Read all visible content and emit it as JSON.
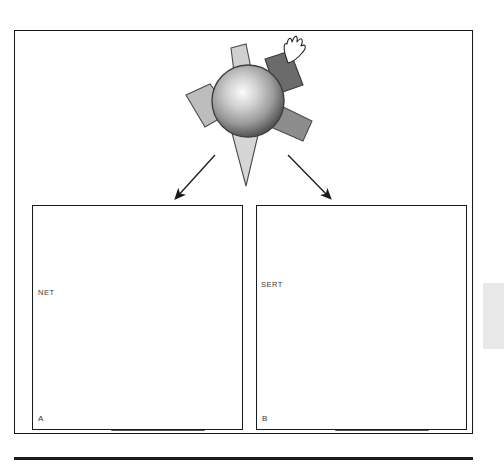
{
  "figure": {
    "type": "biological-diagram",
    "panels": [
      {
        "id": "A",
        "letter": "A",
        "transporter_label": "NET",
        "neurotransmitter_shape": "triangle",
        "receptor_shape": "notched-block",
        "particle_count": 19
      },
      {
        "id": "B",
        "letter": "B",
        "transporter_label": "SERT",
        "neurotransmitter_shape": "capsule",
        "receptor_shape": "square-block",
        "particle_count": 21
      }
    ]
  },
  "central_molecule": {
    "name": "drug-molecule",
    "body": "sphere",
    "arms": [
      {
        "name": "arm-up-left",
        "tone": "light"
      },
      {
        "name": "arm-left",
        "tone": "mid"
      },
      {
        "name": "arm-down",
        "tone": "light"
      },
      {
        "name": "arm-right",
        "tone": "dark"
      },
      {
        "name": "arm-up-right",
        "tone": "darkest"
      }
    ],
    "burst": "white-flame-burst"
  },
  "arrows": [
    {
      "name": "arrow-to-panel-a",
      "direction": "down-left"
    },
    {
      "name": "arrow-to-panel-b",
      "direction": "down-right"
    }
  ],
  "colors": {
    "ink": "#1a1a1a",
    "sphere_core": "#f4f4f4",
    "sphere_mid": "#9a9a9a",
    "sphere_edge": "#4a4a4a",
    "arm_light": "#cfcfcf",
    "arm_mid": "#b2b2b2",
    "arm_dark": "#8f8f8f",
    "arm_darkest": "#6a6a6a",
    "cell_fill": "#f3f3f3",
    "transporter_ring": "#9c9c9c",
    "transporter_core": "#6e6e6e",
    "particle_fill": "#6f6f6f",
    "receptor_fill": "#4d4d4d",
    "vesicle_fill": "#ffffff",
    "margin_tab": "#e8e8e8"
  }
}
